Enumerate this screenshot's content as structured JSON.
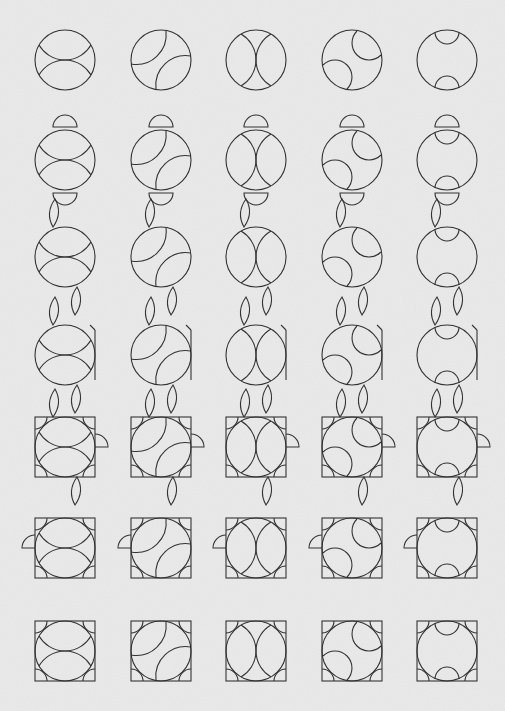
{
  "diagram": {
    "title": "",
    "grid": {
      "rows": 7,
      "columns": 5
    },
    "colors": {
      "background": "#e9e9e9",
      "stroke": "#333333"
    },
    "columns": [
      {
        "id": "c1",
        "inner_arcs": "top-bottom pair meeting at center (horizontal lens pair)"
      },
      {
        "id": "c2",
        "inner_arcs": "diagonal offset pair (rotated lens pair)"
      },
      {
        "id": "c3",
        "inner_arcs": "left-right pair (vertical arcs near sides)"
      },
      {
        "id": "c4",
        "inner_arcs": "corner pair (top-right and bottom-left arcs)"
      },
      {
        "id": "c5",
        "inner_arcs": "small caps at top and bottom"
      }
    ],
    "rows": [
      {
        "id": "r1",
        "stage": "base circle with inner arcs"
      },
      {
        "id": "r2",
        "stage": "top and bottom cap pieces moved outside the circle"
      },
      {
        "id": "r3",
        "stage": "caps rotated into leaf/lens shapes at top-left and bottom-right"
      },
      {
        "id": "r4",
        "stage": "circle split with side notches, small side tabs"
      },
      {
        "id": "r5",
        "stage": "square frame added with corner triangles and side tab"
      },
      {
        "id": "r6",
        "stage": "square frame with left-side tab, corner quarter arcs"
      },
      {
        "id": "r7",
        "stage": "final square frames with inner arcs and corner quarter arcs"
      }
    ],
    "figures": [
      [
        "r1c1",
        "r1c2",
        "r1c3",
        "r1c4",
        "r1c5"
      ],
      [
        "r2c1",
        "r2c2",
        "r2c3",
        "r2c4",
        "r2c5"
      ],
      [
        "r3c1",
        "r3c2",
        "r3c3",
        "r3c4",
        "r3c5"
      ],
      [
        "r4c1",
        "r4c2",
        "r4c3",
        "r4c4",
        "r4c5"
      ],
      [
        "r5c1",
        "r5c2",
        "r5c3",
        "r5c4",
        "r5c5"
      ],
      [
        "r6c1",
        "r6c2",
        "r6c3",
        "r6c4",
        "r6c5"
      ],
      [
        "r7c1",
        "r7c2",
        "r7c3",
        "r7c4",
        "r7c5"
      ]
    ]
  }
}
